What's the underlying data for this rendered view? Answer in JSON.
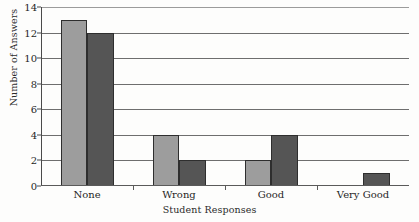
{
  "chart_data": {
    "type": "bar",
    "title": "",
    "xlabel": "Student Responses",
    "ylabel": "Number of Answers",
    "categories": [
      "None",
      "Wrong",
      "Good",
      "Very Good"
    ],
    "series": [
      {
        "name": "Series 1",
        "color": "#9d9d9d",
        "values": [
          13,
          4,
          2,
          0
        ]
      },
      {
        "name": "Series 2",
        "color": "#555555",
        "values": [
          12,
          2,
          4,
          1
        ]
      }
    ],
    "ylim": [
      0,
      14
    ],
    "ytick_step": 2,
    "yticks": [
      0,
      2,
      4,
      6,
      8,
      10,
      12,
      14
    ],
    "ytick_labels": [
      "0",
      "2",
      "4",
      "6",
      "8",
      "10",
      "12",
      "14"
    ],
    "grid": true,
    "grid_axis": "y",
    "legend": false,
    "legend_position": "none",
    "annotations": []
  }
}
